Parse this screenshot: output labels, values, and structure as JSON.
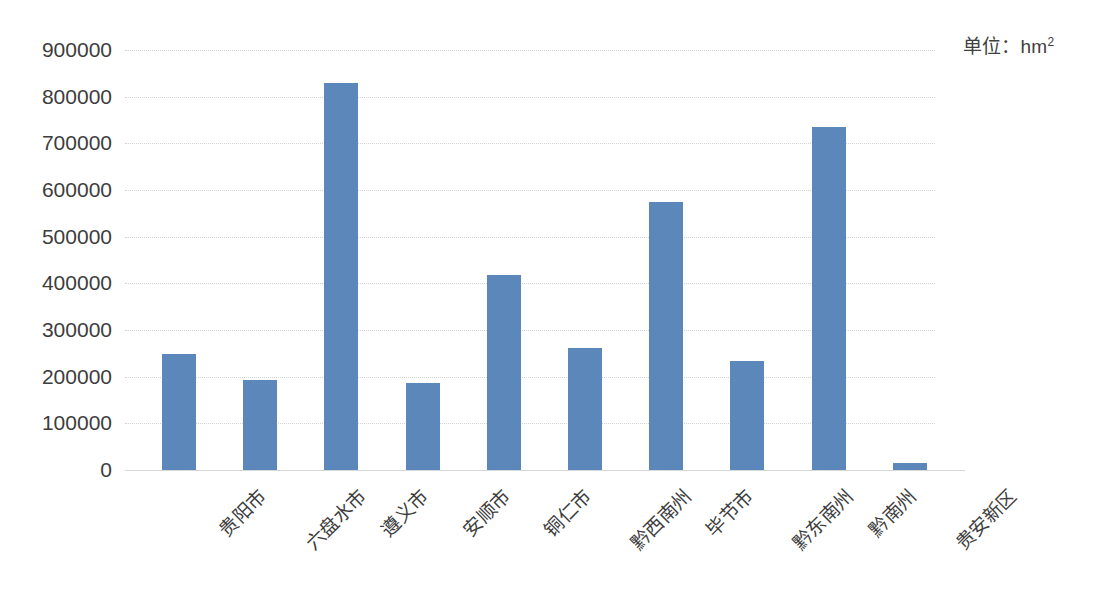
{
  "annotation": {
    "unit_prefix": "单位：hm",
    "unit_exponent": "2"
  },
  "chart_data": {
    "type": "bar",
    "title": "",
    "xlabel": "",
    "ylabel": "",
    "unit": "hm2",
    "unit_label": "单位：hm²",
    "grid": true,
    "legend": "none",
    "ylim": [
      0,
      900000
    ],
    "ytick_step": 100000,
    "ytick_labels": [
      "900000",
      "800000",
      "700000",
      "600000",
      "500000",
      "400000",
      "300000",
      "200000",
      "100000",
      "0"
    ],
    "ytick_values": [
      900000,
      800000,
      700000,
      600000,
      500000,
      400000,
      300000,
      200000,
      100000,
      0
    ],
    "categories": [
      "贵阳市",
      "六盘水市",
      "遵义市",
      "安顺市",
      "铜仁市",
      "黔西南州",
      "毕节市",
      "黔东南州",
      "黔南州",
      "贵安新区"
    ],
    "values": [
      248000,
      192000,
      830000,
      187000,
      418000,
      262000,
      575000,
      234000,
      735000,
      14000
    ],
    "bar_color": "#5b87ba"
  }
}
